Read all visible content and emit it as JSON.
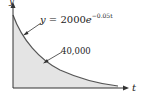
{
  "figure": {
    "y_axis_label": "y",
    "x_axis_label": "t",
    "curve_label": {
      "lhs": "y",
      "equals": " = ",
      "coef": "2000",
      "base": "e",
      "exponent": "−0.05t"
    },
    "area_label": "40,000",
    "colors": {
      "fill": "#e4e4e4",
      "curve": "#555555",
      "axis": "#333333"
    }
  }
}
